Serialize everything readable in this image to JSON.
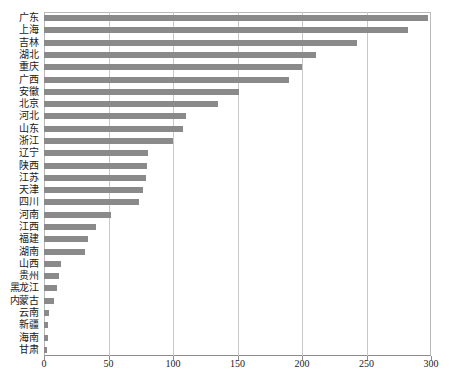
{
  "chart_data": {
    "type": "bar",
    "orientation": "horizontal",
    "title": "",
    "subtitle": "",
    "xlabel": "",
    "ylabel": "",
    "xlim": [
      0,
      300
    ],
    "xticks": [
      0,
      50,
      100,
      150,
      200,
      250,
      300
    ],
    "xtick_labels": [
      "0",
      "50",
      "100",
      "150",
      "200",
      "250",
      "300"
    ],
    "grid": true,
    "grid_axis": "x",
    "legend": false,
    "legend_position": "none",
    "bar_color": "#8a8a8a",
    "grid_color": "#c9c9c9",
    "axis_color": "#8d8d8d",
    "text_color": "#1a1a1a",
    "background_color": "#ffffff",
    "categories": [
      "广东",
      "上海",
      "吉林",
      "湖北",
      "重庆",
      "广西",
      "安徽",
      "北京",
      "河北",
      "山东",
      "浙江",
      "辽宁",
      "陕西",
      "江苏",
      "天津",
      "四川",
      "河南",
      "江西",
      "福建",
      "湖南",
      "山西",
      "贵州",
      "黑龙江",
      "内蒙古",
      "云南",
      "新疆",
      "海南",
      "甘肃"
    ],
    "values": [
      298,
      282,
      243,
      211,
      200,
      190,
      151,
      135,
      110,
      108,
      100,
      81,
      80,
      79,
      77,
      74,
      52,
      40,
      34,
      32,
      13,
      12,
      10,
      8,
      4,
      3,
      3,
      2
    ]
  }
}
